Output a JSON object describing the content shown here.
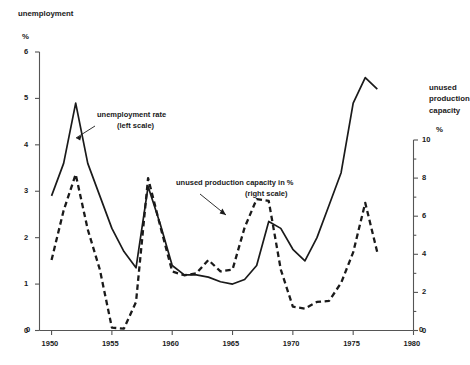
{
  "titles": {
    "left_axis_title": "unemployment",
    "left_axis_unit": "%",
    "right_axis_title": "unused\nproduction\ncapacity",
    "right_axis_unit": "%"
  },
  "annotations": {
    "series1_line1": "unemployment rate",
    "series1_line2": "(left scale)",
    "series2_line1": "unused production capacity in %",
    "series2_line2": "(right scale)"
  },
  "axes": {
    "left_ticks": [
      "0",
      "1",
      "2",
      "3",
      "4",
      "5",
      "6"
    ],
    "right_ticks": [
      "0",
      "2",
      "4",
      "6",
      "8",
      "10"
    ],
    "x_ticks": [
      "1950",
      "1955",
      "1960",
      "1965",
      "1970",
      "1975",
      "1980"
    ],
    "x_origin_label": "0",
    "x_end_label": "0"
  },
  "colors": {
    "ink": "#1a1a1a",
    "axis": "#555555",
    "background": "#ffffff"
  },
  "chart_data": {
    "type": "line",
    "title": "unemployment",
    "xlabel": "",
    "ylabel": "unemployment %",
    "y2label": "unused production capacity %",
    "xlim": [
      1949,
      1980
    ],
    "ylim": [
      0,
      6
    ],
    "y2lim": [
      0,
      10
    ],
    "grid": false,
    "legend_position": "inline-annotations",
    "x": [
      1950,
      1951,
      1952,
      1953,
      1954,
      1955,
      1956,
      1957,
      1958,
      1959,
      1960,
      1961,
      1962,
      1963,
      1964,
      1965,
      1966,
      1967,
      1968,
      1969,
      1970,
      1971,
      1972,
      1973,
      1974,
      1975,
      1976,
      1977
    ],
    "series": [
      {
        "name": "unemployment rate (left scale)",
        "axis": "left",
        "style": "solid",
        "x": [
          1950,
          1951,
          1952,
          1953,
          1954,
          1955,
          1956,
          1957,
          1958,
          1959,
          1960,
          1961,
          1962,
          1963,
          1964,
          1965,
          1966,
          1967,
          1968,
          1969,
          1970,
          1971,
          1972,
          1973,
          1974,
          1975,
          1976,
          1977
        ],
        "values": [
          2.9,
          3.6,
          4.9,
          3.6,
          2.9,
          2.2,
          1.7,
          1.35,
          3.1,
          2.3,
          1.4,
          1.2,
          1.2,
          1.15,
          1.05,
          1.0,
          1.1,
          1.4,
          2.35,
          2.2,
          1.75,
          1.5,
          2.0,
          2.7,
          3.4,
          4.9,
          5.45,
          5.2
        ]
      },
      {
        "name": "unused production capacity in % (right scale)",
        "axis": "right",
        "style": "dashed",
        "x": [
          1950,
          1951,
          1952,
          1953,
          1954,
          1955,
          1956,
          1957,
          1958,
          1959,
          1960,
          1961,
          1962,
          1963,
          1964,
          1965,
          1966,
          1967,
          1968,
          1969,
          1970,
          1971,
          1972,
          1973,
          1974,
          1975,
          1976,
          1977
        ],
        "values": [
          3.7,
          6.3,
          8.2,
          5.3,
          3.2,
          0.15,
          0.1,
          1.5,
          8.0,
          5.5,
          3.1,
          2.9,
          3.0,
          3.7,
          3.1,
          3.2,
          5.4,
          6.9,
          6.8,
          3.2,
          1.25,
          1.15,
          1.5,
          1.55,
          2.5,
          4.1,
          6.7,
          4.1
        ]
      }
    ]
  }
}
